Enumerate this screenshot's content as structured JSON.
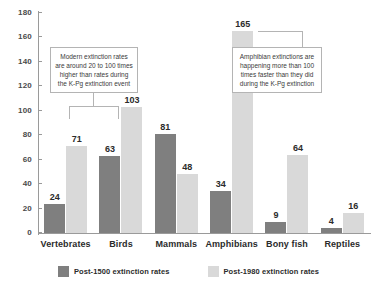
{
  "chart_data": {
    "type": "bar",
    "title": "",
    "subtitle": "",
    "xlabel": "",
    "ylabel": "",
    "ylim": [
      0,
      180
    ],
    "ytick_step": 20,
    "yticks": [
      0,
      20,
      40,
      60,
      80,
      100,
      120,
      140,
      160,
      180
    ],
    "grid": false,
    "legend_position": "bottom",
    "categories": [
      "Vertebrates",
      "Birds",
      "Mammals",
      "Amphibians",
      "Bony fish",
      "Reptiles"
    ],
    "series": [
      {
        "name": "Post-1500 extinction rates",
        "color": "#7f7f7f",
        "values": [
          24,
          63,
          81,
          34,
          9,
          4
        ]
      },
      {
        "name": "Post-1980 extinction rates",
        "color": "#d9d9d9",
        "values": [
          71,
          103,
          48,
          165,
          64,
          16
        ]
      }
    ],
    "annotations": [
      "Modern extinction rates are around 20 to 100 times higher than rates during the K-Pg extinction event",
      "Amphibian extinctions are happening more than 100 times faster than they did during the K-Pg extinction"
    ]
  },
  "yticks": [
    {
      "label": "180"
    },
    {
      "label": "160"
    },
    {
      "label": "140"
    },
    {
      "label": "120"
    },
    {
      "label": "100"
    },
    {
      "label": "80"
    },
    {
      "label": "60"
    },
    {
      "label": "40"
    },
    {
      "label": "20"
    },
    {
      "label": "0"
    }
  ],
  "groups": [
    {
      "label": "Vertebrates",
      "dark": "24",
      "light": "71"
    },
    {
      "label": "Birds",
      "dark": "63",
      "light": "103"
    },
    {
      "label": "Mammals",
      "dark": "81",
      "light": "48"
    },
    {
      "label": "Amphibians",
      "dark": "34",
      "light": "165"
    },
    {
      "label": "Bony fish",
      "dark": "9",
      "light": "64"
    },
    {
      "label": "Reptiles",
      "dark": "4",
      "light": "16"
    }
  ],
  "annotations": {
    "first": "Modern extinction rates are around 20 to 100 times higher than rates during the K-Pg extinction event",
    "second": "Amphibian extinctions are happening more than 100 times faster than they did during the K-Pg extinction"
  },
  "legend": {
    "items": [
      {
        "label": "Post-1500 extinction rates",
        "color": "#7f7f7f"
      },
      {
        "label": "Post-1980 extinction rates",
        "color": "#d9d9d9"
      }
    ]
  }
}
